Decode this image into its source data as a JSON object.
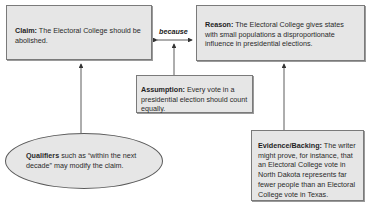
{
  "claim": {
    "label": "Claim:",
    "text": " The Electoral College should be abolished."
  },
  "connector": {
    "label": "because"
  },
  "reason": {
    "label": "Reason:",
    "text": " The Electoral College gives states with small populations a disproportionate influence in presidential elections."
  },
  "assumption": {
    "label": "Assumption:",
    "text": " Every vote in a presidential election should count equally."
  },
  "qualifiers": {
    "label": "Qualifiers",
    "text": " such as “within the next decade” may modify the claim."
  },
  "evidence": {
    "label": "Evidence/Backing:",
    "text": " The writer might prove, for instance, that an Electoral College vote in North Dakota represents far fewer people than an Electoral College vote in Texas."
  },
  "colors": {
    "box_fill": "#e6e6e6",
    "border": "#7a7a7a",
    "arrow": "#333333"
  }
}
